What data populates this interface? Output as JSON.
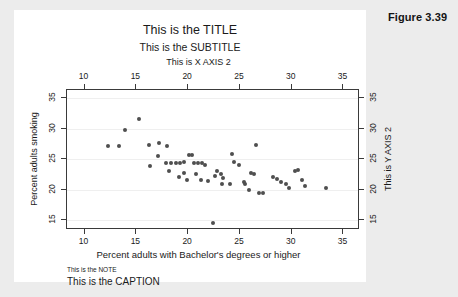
{
  "figure": {
    "label": "Figure 3.39"
  },
  "chart_data": {
    "type": "scatter",
    "title": "This is the TITLE",
    "subtitle": "This is the SUBTITLE",
    "xlabel": "Percent adults with Bachelor's degrees or higher",
    "xlabel_top": "This is X AXIS 2",
    "ylabel": "Percent adults smoking",
    "ylabel_right": "This is Y AXIS 2",
    "note": "This is the NOTE",
    "caption": "This is the CAPTION",
    "xlim": [
      8.3,
      36.6
    ],
    "ylim": [
      13.4,
      36.3
    ],
    "xticks": [
      10,
      15,
      20,
      25,
      30,
      35
    ],
    "yticks": [
      15,
      20,
      25,
      30,
      35
    ],
    "xticks_top": [
      10,
      15,
      20,
      25,
      30,
      35
    ],
    "yticks_right": [
      15,
      20,
      25,
      30,
      35
    ],
    "grid": "horizontal",
    "legend": "none",
    "marker_color": "#4f4f4f",
    "points": [
      {
        "x": 12.3,
        "y": 27.2
      },
      {
        "x": 13.3,
        "y": 27.2
      },
      {
        "x": 13.9,
        "y": 29.8
      },
      {
        "x": 15.3,
        "y": 31.5
      },
      {
        "x": 16.2,
        "y": 27.3
      },
      {
        "x": 17.2,
        "y": 27.6
      },
      {
        "x": 18.0,
        "y": 27.1
      },
      {
        "x": 17.1,
        "y": 25.5
      },
      {
        "x": 17.9,
        "y": 24.3
      },
      {
        "x": 18.3,
        "y": 24.3
      },
      {
        "x": 18.8,
        "y": 24.3
      },
      {
        "x": 19.2,
        "y": 24.4
      },
      {
        "x": 19.6,
        "y": 24.5
      },
      {
        "x": 16.3,
        "y": 23.9
      },
      {
        "x": 18.2,
        "y": 23.0
      },
      {
        "x": 19.6,
        "y": 22.8
      },
      {
        "x": 19.1,
        "y": 22.1
      },
      {
        "x": 19.9,
        "y": 21.6
      },
      {
        "x": 20.1,
        "y": 25.6
      },
      {
        "x": 20.4,
        "y": 25.6
      },
      {
        "x": 20.6,
        "y": 24.3
      },
      {
        "x": 21.0,
        "y": 24.4
      },
      {
        "x": 21.3,
        "y": 24.4
      },
      {
        "x": 21.6,
        "y": 24.0
      },
      {
        "x": 20.8,
        "y": 22.6
      },
      {
        "x": 21.2,
        "y": 21.5
      },
      {
        "x": 21.9,
        "y": 21.4
      },
      {
        "x": 22.4,
        "y": 14.6
      },
      {
        "x": 22.8,
        "y": 23.0
      },
      {
        "x": 22.6,
        "y": 22.3
      },
      {
        "x": 23.2,
        "y": 22.6
      },
      {
        "x": 23.4,
        "y": 21.9
      },
      {
        "x": 24.0,
        "y": 21.0
      },
      {
        "x": 23.3,
        "y": 20.9
      },
      {
        "x": 24.2,
        "y": 25.8
      },
      {
        "x": 24.4,
        "y": 24.6
      },
      {
        "x": 24.9,
        "y": 24.0
      },
      {
        "x": 25.4,
        "y": 21.3
      },
      {
        "x": 25.5,
        "y": 20.9
      },
      {
        "x": 25.9,
        "y": 20.0
      },
      {
        "x": 26.1,
        "y": 22.8
      },
      {
        "x": 26.4,
        "y": 22.6
      },
      {
        "x": 26.6,
        "y": 27.3
      },
      {
        "x": 26.8,
        "y": 19.5
      },
      {
        "x": 27.2,
        "y": 19.4
      },
      {
        "x": 28.2,
        "y": 22.0
      },
      {
        "x": 28.6,
        "y": 21.8
      },
      {
        "x": 29.0,
        "y": 21.2
      },
      {
        "x": 29.5,
        "y": 21.0
      },
      {
        "x": 29.7,
        "y": 20.3
      },
      {
        "x": 30.3,
        "y": 23.0
      },
      {
        "x": 30.6,
        "y": 23.2
      },
      {
        "x": 31.0,
        "y": 21.5
      },
      {
        "x": 31.3,
        "y": 20.6
      },
      {
        "x": 33.3,
        "y": 20.2
      }
    ]
  }
}
